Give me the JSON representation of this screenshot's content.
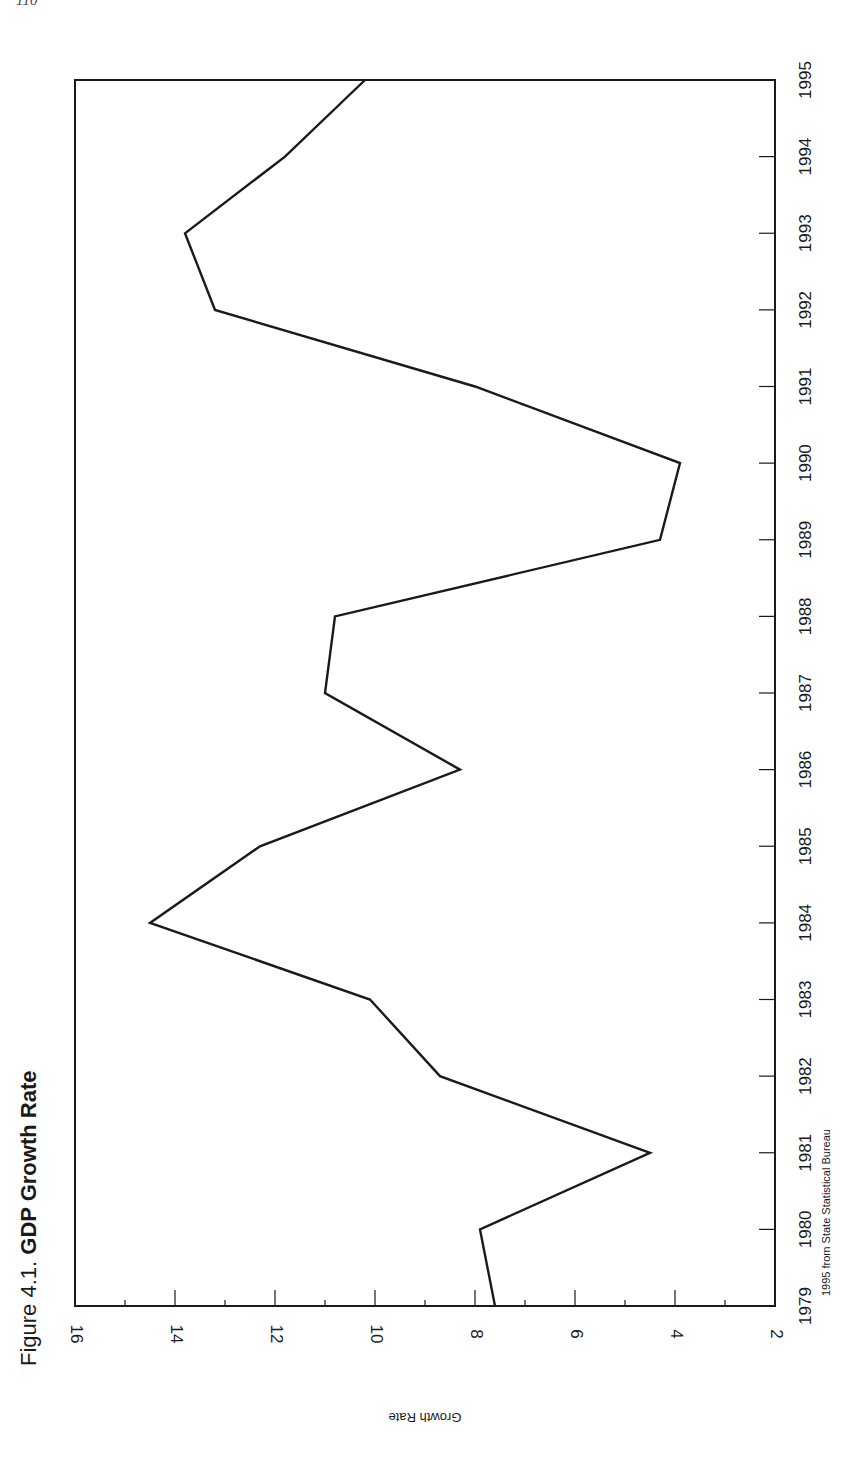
{
  "page": {
    "number": "110"
  },
  "figure": {
    "label": "Figure 4.1.",
    "title": "GDP Growth Rate",
    "source_note": "1995 from State Statistical Bureau",
    "orientation": "rotated 90° (landscape chart printed on portrait page)"
  },
  "chart_data": {
    "type": "line",
    "title": "Figure 4.1. GDP Growth Rate",
    "xlabel": "",
    "ylabel": "Growth Rate",
    "x": [
      1979,
      1980,
      1981,
      1982,
      1983,
      1984,
      1985,
      1986,
      1987,
      1988,
      1989,
      1990,
      1991,
      1992,
      1993,
      1994,
      1995
    ],
    "categories": [
      "1979",
      "1980",
      "1981",
      "1982",
      "1983",
      "1984",
      "1985",
      "1986",
      "1987",
      "1988",
      "1989",
      "1990",
      "1991",
      "1992",
      "1993",
      "1994",
      "1995"
    ],
    "series": [
      {
        "name": "GDP Growth Rate",
        "values": [
          7.6,
          7.9,
          4.5,
          8.7,
          10.1,
          14.5,
          12.3,
          8.3,
          11.0,
          10.8,
          4.3,
          3.9,
          8.0,
          13.2,
          13.8,
          11.8,
          10.2
        ]
      }
    ],
    "ylim": [
      2,
      16
    ],
    "yticks": [
      2,
      4,
      6,
      8,
      10,
      12,
      14,
      16
    ],
    "ytick_labels": [
      "2",
      "4",
      "6",
      "8",
      "10",
      "12",
      "14",
      "16"
    ],
    "xtick_labels": [
      "1979",
      "1980",
      "1981",
      "1982",
      "1983",
      "1984",
      "1985",
      "1986",
      "1987",
      "1988",
      "1989",
      "1990",
      "1991",
      "1992",
      "1993",
      "1994",
      "1995"
    ],
    "grid": false,
    "legend": "none",
    "annotations": [
      "1995 from State Statistical Bureau"
    ],
    "line_color": "#1a1a1a"
  }
}
